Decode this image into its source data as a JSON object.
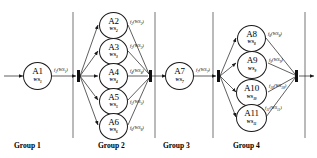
{
  "diagram": {
    "stroke_color": "#1a1a1a",
    "bar_color": "#111111",
    "background": "#ffffff"
  },
  "groups": [
    {
      "id": "group-1",
      "label": "Group 1"
    },
    {
      "id": "group-2",
      "label": "Group 2"
    },
    {
      "id": "group-3",
      "label": "Group 3"
    },
    {
      "id": "group-4",
      "label": "Group 4"
    }
  ],
  "nodes": [
    {
      "id": "A1",
      "ws": "WS",
      "ws_sub": "1",
      "group": 1
    },
    {
      "id": "A2",
      "ws": "WS",
      "ws_sub": "2",
      "group": 2
    },
    {
      "id": "A3",
      "ws": "WS",
      "ws_sub": "3",
      "group": 2
    },
    {
      "id": "A4",
      "ws": "WS",
      "ws_sub": "4",
      "group": 2
    },
    {
      "id": "A5",
      "ws": "WS",
      "ws_sub": "5",
      "group": 2
    },
    {
      "id": "A6",
      "ws": "WS",
      "ws_sub": "6",
      "group": 2
    },
    {
      "id": "A7",
      "ws": "WS",
      "ws_sub": "7",
      "group": 3
    },
    {
      "id": "A8",
      "ws": "WS",
      "ws_sub": "8",
      "group": 4
    },
    {
      "id": "A9",
      "ws": "WS",
      "ws_sub": "9",
      "group": 4
    },
    {
      "id": "A10",
      "ws": "WS",
      "ws_sub": "10",
      "group": 4
    },
    {
      "id": "A11",
      "ws": "WS",
      "ws_sub": "11",
      "group": 4
    }
  ],
  "edge_labels": [
    {
      "id": "f1",
      "fn": "f",
      "fn_sub": "1",
      "arg": "WS",
      "arg_sub": "1"
    },
    {
      "id": "f2",
      "fn": "f",
      "fn_sub": "2",
      "arg": "WS",
      "arg_sub": "2"
    },
    {
      "id": "f3",
      "fn": "f",
      "fn_sub": "3",
      "arg": "WS",
      "arg_sub": "3"
    },
    {
      "id": "f4",
      "fn": "f",
      "fn_sub": "4",
      "arg": "WS",
      "arg_sub": "4"
    },
    {
      "id": "f5",
      "fn": "f",
      "fn_sub": "5",
      "arg": "WS",
      "arg_sub": "5"
    },
    {
      "id": "f6",
      "fn": "f",
      "fn_sub": "6",
      "arg": "WS",
      "arg_sub": "6"
    },
    {
      "id": "f7",
      "fn": "f",
      "fn_sub": "7",
      "arg": "WS",
      "arg_sub": "7"
    },
    {
      "id": "f8",
      "fn": "f",
      "fn_sub": "8",
      "arg": "WS",
      "arg_sub": "8"
    },
    {
      "id": "f9",
      "fn": "f",
      "fn_sub": "9",
      "arg": "WS",
      "arg_sub": "9"
    },
    {
      "id": "f10",
      "fn": "f",
      "fn_sub": "10",
      "arg": "WS",
      "arg_sub": "10"
    },
    {
      "id": "f11",
      "fn": "f",
      "fn_sub": "11",
      "arg": "WS",
      "arg_sub": "11"
    }
  ]
}
